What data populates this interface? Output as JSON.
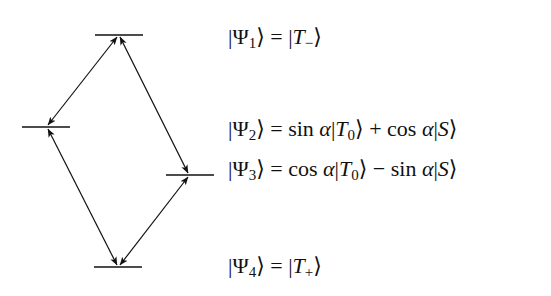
{
  "diagram": {
    "colors": {
      "line": "#111111",
      "background": "#ffffff"
    },
    "levels": [
      {
        "id": "psi1",
        "label": "|Ψ1⟩",
        "x1": 95,
        "x2": 143,
        "y": 35
      },
      {
        "id": "psi2",
        "label": "|Ψ2⟩",
        "x1": 22,
        "x2": 70,
        "y": 127
      },
      {
        "id": "psi3",
        "label": "|Ψ3⟩",
        "x1": 166,
        "x2": 214,
        "y": 175
      },
      {
        "id": "psi4",
        "label": "|Ψ4⟩",
        "x1": 94,
        "x2": 142,
        "y": 267
      }
    ],
    "transitions": [
      {
        "from": "psi1",
        "to": "psi2",
        "arrows": "both"
      },
      {
        "from": "psi1",
        "to": "psi3",
        "arrows": "both"
      },
      {
        "from": "psi2",
        "to": "psi4",
        "arrows": "both"
      },
      {
        "from": "psi3",
        "to": "psi4",
        "arrows": "both"
      }
    ]
  },
  "equations": [
    {
      "lhs_state": "Ψ",
      "lhs_sub": "1",
      "rhs": "|T−⟩",
      "rhs_parts": {
        "state": "T",
        "sub": "−"
      }
    },
    {
      "lhs_state": "Ψ",
      "lhs_sub": "2",
      "rhs": "sin α|T0⟩ + cos α|S⟩",
      "rhs_parts": {
        "f1": "sin",
        "op": "+",
        "f2": "cos"
      }
    },
    {
      "lhs_state": "Ψ",
      "lhs_sub": "3",
      "rhs": "cos α|T0⟩ − sin α|S⟩",
      "rhs_parts": {
        "f1": "cos",
        "op": "−",
        "f2": "sin"
      }
    },
    {
      "lhs_state": "Ψ",
      "lhs_sub": "4",
      "rhs": "|T+⟩",
      "rhs_parts": {
        "state": "T",
        "sub": "+"
      }
    }
  ]
}
